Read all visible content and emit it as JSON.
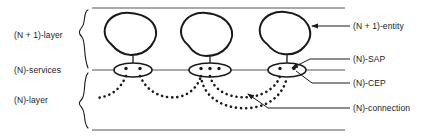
{
  "diagram": {
    "left_labels": [
      {
        "id": "n1-layer",
        "text": "(N + 1)-layer"
      },
      {
        "id": "n-services",
        "text": "(N)-services"
      },
      {
        "id": "n-layer",
        "text": "(N)-layer"
      }
    ],
    "right_labels": [
      {
        "id": "n1-entity",
        "text": "(N + 1)-entity"
      },
      {
        "id": "n-sap",
        "text": "(N)-SAP"
      },
      {
        "id": "n-cep",
        "text": "(N)-CEP"
      },
      {
        "id": "n-conn",
        "text": "(N)-connection"
      }
    ],
    "entities": [
      {
        "id": "entity-1",
        "cep_count": 2
      },
      {
        "id": "entity-2",
        "cep_count": 3
      },
      {
        "id": "entity-3",
        "cep_count": 2
      }
    ],
    "connections": [
      {
        "id": "connection-dangling-left",
        "from": "entity-1",
        "to": "edge-left"
      },
      {
        "id": "connection-1-2",
        "from": "entity-1",
        "to": "entity-2"
      },
      {
        "id": "connection-2-3-upper",
        "from": "entity-2",
        "to": "entity-3"
      },
      {
        "id": "connection-2-3-lower",
        "from": "entity-2",
        "to": "entity-3"
      }
    ],
    "colors": {
      "stroke": "#1a1a1a",
      "thin_line": "#555555",
      "background": "#ffffff"
    }
  }
}
